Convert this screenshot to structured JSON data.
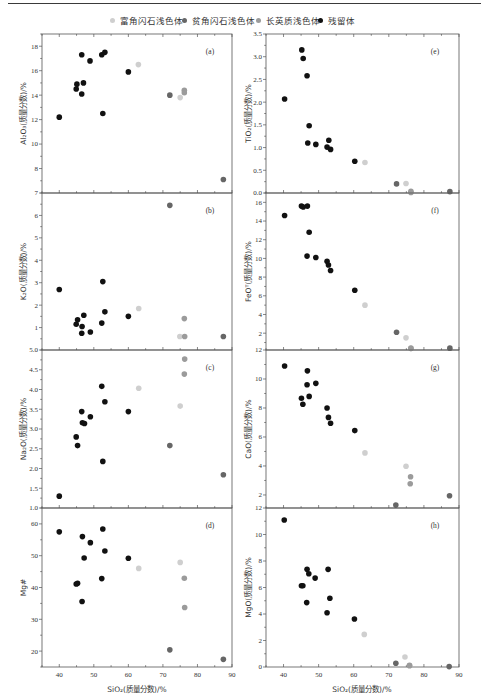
{
  "legend": {
    "items": [
      {
        "label": "富角闪石浅色体",
        "color": "#cfcfcf"
      },
      {
        "label": "贫角闪石浅色体",
        "color": "#666666"
      },
      {
        "label": "长英质浅色体",
        "color": "#9b9b9b"
      },
      {
        "label": "残留体",
        "color": "#111111"
      }
    ]
  },
  "chart_data": [
    {
      "type": "scatter",
      "panel_label": "(a)",
      "title": "",
      "xlabel": "SiO₂(质量分数)/%",
      "ylabel": "Al₂O₃(质量分数)/%",
      "xlim": [
        35,
        90
      ],
      "ylim": [
        6,
        19
      ],
      "xticks": [
        "40",
        "50",
        "60",
        "70",
        "80",
        "90"
      ],
      "yticks": [
        "8",
        "10",
        "12",
        "14",
        "16",
        "18"
      ],
      "grid": false,
      "series": [
        {
          "name": "富角闪石浅色体",
          "points": [
            [
              62.9,
              16.5
            ],
            [
              75.0,
              13.8
            ]
          ]
        },
        {
          "name": "贫角闪石浅色体",
          "points": [
            [
              72.0,
              14.0
            ],
            [
              87.5,
              7.1
            ]
          ]
        },
        {
          "name": "长英质浅色体",
          "points": [
            [
              76.2,
              14.4
            ],
            [
              76.2,
              14.2
            ]
          ]
        },
        {
          "name": "残留体",
          "points": [
            [
              40.0,
              12.2
            ],
            [
              44.9,
              14.5
            ],
            [
              45.1,
              14.9
            ],
            [
              46.5,
              17.3
            ],
            [
              46.5,
              14.1
            ],
            [
              47.0,
              15.0
            ],
            [
              48.9,
              16.8
            ],
            [
              52.3,
              17.3
            ],
            [
              53.2,
              17.5
            ],
            [
              52.6,
              12.5
            ],
            [
              60.0,
              15.9
            ]
          ]
        }
      ]
    },
    {
      "type": "scatter",
      "panel_label": "(b)",
      "title": "",
      "xlabel": "SiO₂(质量分数)/%",
      "ylabel": "K₂O(质量分数)/%",
      "xlim": [
        35,
        90
      ],
      "ylim": [
        0,
        7
      ],
      "xticks": [
        "40",
        "50",
        "60",
        "70",
        "80",
        "90"
      ],
      "yticks": [
        "1",
        "2",
        "3",
        "4",
        "5",
        "6",
        "7"
      ],
      "grid": false,
      "series": [
        {
          "name": "富角闪石浅色体",
          "points": [
            [
              63.0,
              1.85
            ],
            [
              74.9,
              0.6
            ]
          ]
        },
        {
          "name": "贫角闪石浅色体",
          "points": [
            [
              72.0,
              6.45
            ],
            [
              87.5,
              0.6
            ]
          ]
        },
        {
          "name": "长英质浅色体",
          "points": [
            [
              76.2,
              1.4
            ],
            [
              76.3,
              0.6
            ]
          ]
        },
        {
          "name": "残留体",
          "points": [
            [
              40.0,
              2.7
            ],
            [
              44.9,
              1.15
            ],
            [
              45.3,
              1.35
            ],
            [
              46.6,
              1.05
            ],
            [
              46.5,
              0.75
            ],
            [
              47.1,
              1.55
            ],
            [
              49.0,
              0.8
            ],
            [
              52.3,
              1.2
            ],
            [
              52.6,
              3.05
            ],
            [
              53.2,
              1.7
            ],
            [
              60.0,
              1.5
            ]
          ]
        }
      ]
    },
    {
      "type": "scatter",
      "panel_label": "(c)",
      "title": "",
      "xlabel": "SiO₂(质量分数)/%",
      "ylabel": "Na₂O(质量分数)/%",
      "xlim": [
        35,
        90
      ],
      "ylim": [
        1.0,
        5.0
      ],
      "xticks": [
        "40",
        "50",
        "60",
        "70",
        "80",
        "90"
      ],
      "yticks": [
        "1.0",
        "1.5",
        "2.0",
        "2.5",
        "3.0",
        "3.5",
        "4.0",
        "4.5",
        "5.0"
      ],
      "grid": false,
      "series": [
        {
          "name": "富角闪石浅色体",
          "points": [
            [
              63.0,
              4.03
            ],
            [
              75.0,
              3.58
            ]
          ]
        },
        {
          "name": "贫角闪石浅色体",
          "points": [
            [
              72.0,
              2.58
            ],
            [
              87.5,
              1.84
            ]
          ]
        },
        {
          "name": "长英质浅色体",
          "points": [
            [
              76.3,
              4.77
            ],
            [
              76.2,
              4.39
            ]
          ]
        },
        {
          "name": "残留体",
          "points": [
            [
              40.0,
              1.3
            ],
            [
              44.9,
              2.8
            ],
            [
              45.3,
              2.58
            ],
            [
              46.5,
              3.44
            ],
            [
              46.7,
              3.16
            ],
            [
              47.3,
              3.14
            ],
            [
              49.0,
              3.31
            ],
            [
              52.3,
              4.08
            ],
            [
              53.2,
              3.69
            ],
            [
              52.6,
              2.18
            ],
            [
              60.0,
              3.44
            ]
          ]
        }
      ]
    },
    {
      "type": "scatter",
      "panel_label": "(d)",
      "title": "",
      "xlabel": "SiO₂(质量分数)/%",
      "ylabel": "Mg#",
      "xlim": [
        35,
        90
      ],
      "ylim": [
        15,
        65
      ],
      "xticks": [
        "40",
        "50",
        "60",
        "70",
        "80",
        "90"
      ],
      "yticks": [
        "20",
        "30",
        "40",
        "50",
        "60"
      ],
      "grid": false,
      "series": [
        {
          "name": "富角闪石浅色体",
          "points": [
            [
              63.0,
              46.0
            ],
            [
              75.0,
              47.9
            ]
          ]
        },
        {
          "name": "贫角闪石浅色体",
          "points": [
            [
              72.0,
              20.4
            ],
            [
              87.5,
              17.4
            ]
          ]
        },
        {
          "name": "长英质浅色体",
          "points": [
            [
              76.2,
              42.9
            ],
            [
              76.3,
              33.7
            ]
          ]
        },
        {
          "name": "残留体",
          "points": [
            [
              40.0,
              57.5
            ],
            [
              46.7,
              56.0
            ],
            [
              49.0,
              54.1
            ],
            [
              52.6,
              58.4
            ],
            [
              53.2,
              51.5
            ],
            [
              47.2,
              49.3
            ],
            [
              60.0,
              49.2
            ],
            [
              44.9,
              41.1
            ],
            [
              45.3,
              41.3
            ],
            [
              52.3,
              42.8
            ],
            [
              46.6,
              35.6
            ]
          ]
        }
      ]
    },
    {
      "type": "scatter",
      "panel_label": "(e)",
      "title": "",
      "xlabel": "SiO₂(质量分数)/%",
      "ylabel": "TiO₂(质量分数)/%",
      "xlim": [
        35,
        90
      ],
      "ylim": [
        0,
        3.5
      ],
      "xticks": [
        "40",
        "50",
        "60",
        "70",
        "80",
        "90"
      ],
      "yticks": [
        "0.0",
        "0.5",
        "1.0",
        "1.5",
        "2.0",
        "2.5",
        "3.0",
        "3.5"
      ],
      "grid": false,
      "series": [
        {
          "name": "富角闪石浅色体",
          "points": [
            [
              63.2,
              0.67
            ],
            [
              74.9,
              0.21
            ]
          ]
        },
        {
          "name": "贫角闪石浅色体",
          "points": [
            [
              72.2,
              0.2
            ],
            [
              87.4,
              0.03
            ]
          ]
        },
        {
          "name": "长英质浅色体",
          "points": [
            [
              76.3,
              0.04
            ],
            [
              76.3,
              0.01
            ]
          ]
        },
        {
          "name": "残留体",
          "points": [
            [
              40.3,
              2.07
            ],
            [
              45.2,
              3.15
            ],
            [
              45.6,
              2.96
            ],
            [
              46.7,
              2.58
            ],
            [
              47.3,
              1.48
            ],
            [
              46.9,
              1.1
            ],
            [
              49.2,
              1.07
            ],
            [
              52.9,
              1.16
            ],
            [
              52.4,
              1.01
            ],
            [
              53.4,
              0.96
            ],
            [
              60.3,
              0.7
            ]
          ]
        }
      ]
    },
    {
      "type": "scatter",
      "panel_label": "(f)",
      "title": "",
      "xlabel": "SiO₂(质量分数)/%",
      "ylabel": "FeOᵀ(质量分数)/%",
      "xlim": [
        35,
        90
      ],
      "ylim": [
        0.2,
        17
      ],
      "xticks": [
        "40",
        "50",
        "60",
        "70",
        "80",
        "90"
      ],
      "yticks": [
        "2",
        "4",
        "6",
        "8",
        "10",
        "12",
        "14",
        "16"
      ],
      "grid": false,
      "series": [
        {
          "name": "富角闪石浅色体",
          "points": [
            [
              63.2,
              5.0
            ],
            [
              74.9,
              1.5
            ]
          ]
        },
        {
          "name": "贫角闪石浅色体",
          "points": [
            [
              72.2,
              2.1
            ],
            [
              87.4,
              0.4
            ]
          ]
        },
        {
          "name": "长英质浅色体",
          "points": [
            [
              76.3,
              0.4
            ],
            [
              76.3,
              0.35
            ]
          ]
        },
        {
          "name": "残留体",
          "points": [
            [
              40.3,
              14.6
            ],
            [
              45.1,
              15.6
            ],
            [
              45.6,
              15.5
            ],
            [
              46.8,
              15.6
            ],
            [
              47.3,
              12.8
            ],
            [
              46.7,
              10.25
            ],
            [
              49.2,
              10.1
            ],
            [
              52.4,
              9.7
            ],
            [
              52.8,
              9.3
            ],
            [
              53.4,
              8.7
            ],
            [
              60.3,
              6.6
            ]
          ]
        }
      ]
    },
    {
      "type": "scatter",
      "panel_label": "(g)",
      "title": "",
      "xlabel": "SiO₂(质量分数)/%",
      "ylabel": "CaO(质量分数)/%",
      "xlim": [
        35,
        90
      ],
      "ylim": [
        1.1,
        12
      ],
      "xticks": [
        "40",
        "50",
        "60",
        "70",
        "80",
        "90"
      ],
      "yticks": [
        "2",
        "4",
        "6",
        "8",
        "10",
        "12"
      ],
      "grid": false,
      "series": [
        {
          "name": "富角闪石浅色体",
          "points": [
            [
              63.2,
              4.9
            ],
            [
              74.9,
              3.98
            ]
          ]
        },
        {
          "name": "贫角闪石浅色体",
          "points": [
            [
              72.0,
              1.3
            ],
            [
              87.3,
              1.95
            ]
          ]
        },
        {
          "name": "长英质浅色体",
          "points": [
            [
              76.2,
              3.26
            ],
            [
              76.1,
              2.77
            ]
          ]
        },
        {
          "name": "残留体",
          "points": [
            [
              40.3,
              10.9
            ],
            [
              46.8,
              10.56
            ],
            [
              46.7,
              9.6
            ],
            [
              49.2,
              9.7
            ],
            [
              45.1,
              8.67
            ],
            [
              45.5,
              8.26
            ],
            [
              47.3,
              8.8
            ],
            [
              52.4,
              8.0
            ],
            [
              52.8,
              7.35
            ],
            [
              53.4,
              6.95
            ],
            [
              60.3,
              6.44
            ]
          ]
        }
      ]
    },
    {
      "type": "scatter",
      "panel_label": "(h)",
      "title": "",
      "xlabel": "SiO₂(质量分数)/%",
      "ylabel": "MgO(质量分数)/%",
      "xlim": [
        35,
        90
      ],
      "ylim": [
        0,
        12
      ],
      "xticks": [
        "40",
        "50",
        "60",
        "70",
        "80",
        "90"
      ],
      "yticks": [
        "0",
        "2",
        "4",
        "6",
        "8",
        "10",
        "12"
      ],
      "grid": false,
      "series": [
        {
          "name": "富角闪石浅色体",
          "points": [
            [
              63.0,
              2.46
            ],
            [
              74.6,
              0.76
            ]
          ]
        },
        {
          "name": "贫角闪石浅色体",
          "points": [
            [
              72.0,
              0.28
            ],
            [
              87.2,
              0.03
            ]
          ]
        },
        {
          "name": "长英质浅色体",
          "points": [
            [
              75.9,
              0.13
            ],
            [
              75.9,
              0.1
            ]
          ]
        },
        {
          "name": "残留体",
          "points": [
            [
              40.2,
              11.1
            ],
            [
              46.7,
              7.37
            ],
            [
              47.2,
              7.04
            ],
            [
              49.0,
              6.71
            ],
            [
              52.7,
              7.37
            ],
            [
              45.1,
              6.13
            ],
            [
              45.5,
              6.13
            ],
            [
              46.6,
              4.86
            ],
            [
              53.2,
              5.19
            ],
            [
              52.4,
              4.1
            ],
            [
              60.2,
              3.62
            ]
          ]
        }
      ]
    }
  ],
  "footer": {
    "xlabel_left": "SiO₂(质量分数)/%",
    "xlabel_right": "SiO₂(质量分数)/%"
  }
}
